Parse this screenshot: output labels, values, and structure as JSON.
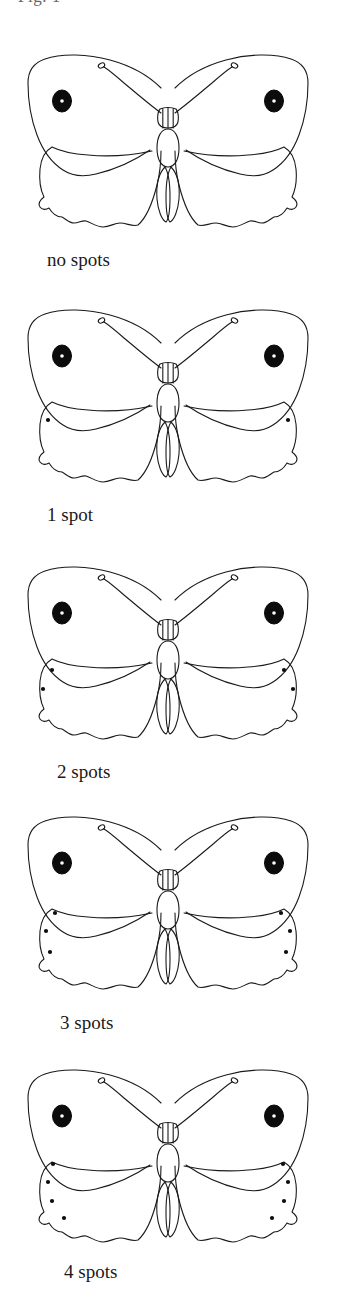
{
  "page": {
    "width": 337,
    "height": 1294,
    "background_color": "#ffffff",
    "ink_color": "#1a1a1a"
  },
  "caption_remnant": {
    "text": "Fig. 1",
    "note": "bottom sliver of a caption line cropped off at the top edge of the image"
  },
  "specimens": [
    {
      "id": "butterfly-no-spots",
      "label": "no spots",
      "spot_count": 0,
      "label_left": 47,
      "label_top": 250,
      "figure_top": 33,
      "eyespot": true,
      "spots_per_hindwing": []
    },
    {
      "id": "butterfly-1-spot",
      "label": "1 spot",
      "spot_count": 1,
      "label_left": 47,
      "label_top": 505,
      "figure_top": 288,
      "eyespot": true,
      "spots_per_hindwing": [
        {
          "x": 48,
          "y": 132
        }
      ]
    },
    {
      "id": "butterfly-2-spots",
      "label": "2 spots",
      "spot_count": 2,
      "label_left": 57,
      "label_top": 762,
      "figure_top": 545,
      "eyespot": true,
      "spots_per_hindwing": [
        {
          "x": 52,
          "y": 125
        },
        {
          "x": 43,
          "y": 144
        }
      ]
    },
    {
      "id": "butterfly-3-spots",
      "label": "3 spots",
      "spot_count": 3,
      "label_left": 60,
      "label_top": 1013,
      "figure_top": 795,
      "eyespot": true,
      "spots_per_hindwing": [
        {
          "x": 55,
          "y": 118
        },
        {
          "x": 46,
          "y": 136
        },
        {
          "x": 50,
          "y": 157
        }
      ]
    },
    {
      "id": "butterfly-4-spots",
      "label": "4 spots",
      "spot_count": 4,
      "label_left": 64,
      "label_top": 1262,
      "figure_top": 1048,
      "eyespot": true,
      "spots_per_hindwing": [
        {
          "x": 53,
          "y": 116
        },
        {
          "x": 48,
          "y": 134
        },
        {
          "x": 52,
          "y": 153
        },
        {
          "x": 64,
          "y": 170
        }
      ]
    }
  ],
  "chart_data": {
    "type": "table",
    "categories": [
      "no spots",
      "1 spot",
      "2 spots",
      "3 spots",
      "4 spots"
    ],
    "values": [
      0,
      1,
      2,
      3,
      4
    ],
    "xlabel": "variant",
    "ylabel": "number of spots per hindwing"
  }
}
